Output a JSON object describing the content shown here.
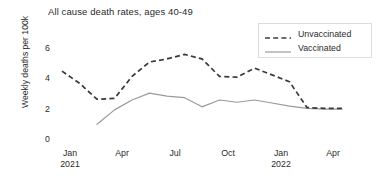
{
  "chart_data": {
    "type": "line",
    "title": "All cause death rates, ages 40-49",
    "xlabel": "",
    "ylabel": "Weekly deaths per 100k",
    "ylim": [
      0,
      7
    ],
    "yticks": [
      0,
      2,
      4,
      6
    ],
    "xlim": [
      "2020-12-15",
      "2022-04-15"
    ],
    "xticks": [
      {
        "main": "Jan",
        "sub": "2021"
      },
      {
        "main": "Apr",
        "sub": ""
      },
      {
        "main": "Jul",
        "sub": ""
      },
      {
        "main": "Oct",
        "sub": ""
      },
      {
        "main": "Jan",
        "sub": "2022"
      },
      {
        "main": "Apr",
        "sub": ""
      }
    ],
    "grid": false,
    "legend_position": "top-right",
    "x": [
      "2021-01-01",
      "2021-02-01",
      "2021-03-01",
      "2021-04-01",
      "2021-05-01",
      "2021-06-01",
      "2021-07-01",
      "2021-08-01",
      "2021-09-01",
      "2021-10-01",
      "2021-11-01",
      "2021-12-01",
      "2022-01-01",
      "2022-02-01",
      "2022-03-01"
    ],
    "series": [
      {
        "name": "Unvaccinated",
        "style": "dashed",
        "color": "#3a3a3a",
        "values": [
          4.5,
          3.7,
          2.65,
          2.7,
          4.15,
          5.1,
          5.3,
          5.6,
          5.3,
          4.15,
          4.1,
          4.7,
          4.25,
          3.8,
          2.1
        ]
      },
      {
        "name": "Vaccinated",
        "style": "solid",
        "color": "#9a9a9a",
        "values": [
          null,
          null,
          1.0,
          1.95,
          2.6,
          3.05,
          2.85,
          2.75,
          2.15,
          2.6,
          2.45,
          2.6,
          2.4,
          2.2,
          2.05
        ]
      }
    ],
    "series_tail": [
      {
        "name": "Unvaccinated",
        "values": [
          2.05,
          2.05
        ]
      },
      {
        "name": "Vaccinated",
        "values": [
          2.0,
          2.0
        ]
      }
    ]
  },
  "legend": {
    "items": [
      {
        "label": "Unvaccinated"
      },
      {
        "label": "Vaccinated"
      }
    ]
  }
}
